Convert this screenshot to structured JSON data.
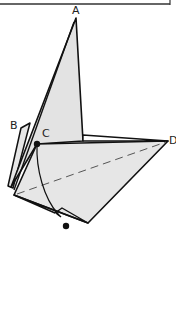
{
  "diagram": {
    "type": "geometric-fold-figure",
    "colors": {
      "stroke": "#111111",
      "fill": "#e6e6e6",
      "dash": "#555555",
      "background": "#ffffff",
      "frame": "#333333"
    },
    "labels": {
      "A": "A",
      "B": "B",
      "C": "C",
      "D": "D"
    },
    "points": {
      "A": [
        76,
        18
      ],
      "C": [
        37,
        144
      ],
      "D": [
        168,
        141
      ],
      "bottom_left": [
        14,
        195
      ],
      "bottom": [
        88,
        223
      ],
      "arc_end_dot": [
        66,
        226
      ]
    }
  }
}
